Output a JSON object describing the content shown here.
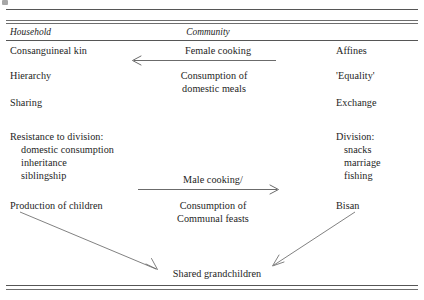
{
  "figure": {
    "title_visible": false,
    "columns": {
      "household_header": "Household",
      "community_header": "Community"
    },
    "left_column": [
      "Consanguineal kin",
      "Hierarchy",
      "Sharing",
      "Resistance to division:",
      "domestic consumption",
      "inheritance",
      "siblingship",
      "Production of children"
    ],
    "middle_column": [
      "Female cooking",
      "Consumption of",
      "domestic meals",
      "Male cooking/",
      "Consumption of",
      "Communal feasts"
    ],
    "right_column": [
      "Affines",
      "'Equality'",
      "Exchange",
      "Division:",
      "snacks",
      "marriage",
      "fishing",
      "Bisan"
    ],
    "bottom_label": "Shared grandchildren",
    "arrows": [
      {
        "name": "female-cooking-arrow",
        "direction": "left",
        "label": "Female cooking"
      },
      {
        "name": "male-cooking-arrow",
        "direction": "right",
        "label": "Male cooking/"
      },
      {
        "name": "production-to-grandchildren-arrow",
        "direction": "down-right",
        "label": ""
      },
      {
        "name": "bisan-to-grandchildren-arrow",
        "direction": "down-left",
        "label": ""
      }
    ],
    "colors": {
      "ink": "#1e1e1e",
      "rule": "#4d4d4d",
      "arrow": "#5a5a5a",
      "background": "#ffffff"
    }
  }
}
